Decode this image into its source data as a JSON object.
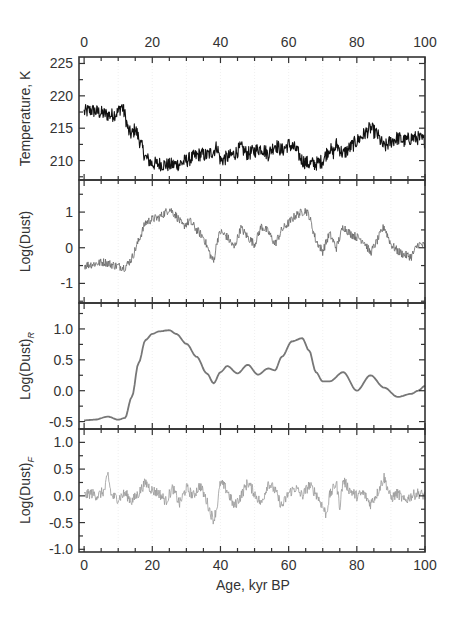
{
  "chart_data": [
    {
      "type": "line",
      "panel": 1,
      "ylabel": "Temperature, K",
      "ylim": [
        207,
        226
      ],
      "yticks": [
        210,
        215,
        220,
        225
      ],
      "color": "#111111",
      "noise": 1.1,
      "x": [
        0,
        2,
        4,
        6,
        8,
        10,
        11,
        12,
        13,
        14,
        15,
        16,
        18,
        20,
        22,
        25,
        28,
        30,
        32,
        34,
        36,
        38,
        39,
        40,
        42,
        44,
        46,
        48,
        50,
        52,
        54,
        56,
        58,
        60,
        62,
        64,
        66,
        68,
        70,
        72,
        73,
        74,
        76,
        78,
        80,
        82,
        84,
        86,
        88,
        90,
        92,
        94,
        96,
        98,
        100
      ],
      "values": [
        217.5,
        217.8,
        217.5,
        217.2,
        217.0,
        217.5,
        218.5,
        217.0,
        214.5,
        214.0,
        215.0,
        213.5,
        210.5,
        209.5,
        209.5,
        209.3,
        209.5,
        210.0,
        210.5,
        211.0,
        210.8,
        211.5,
        212.2,
        210.0,
        210.5,
        211.0,
        212.0,
        211.0,
        211.5,
        212.0,
        211.0,
        212.5,
        211.5,
        212.5,
        211.8,
        210.0,
        209.5,
        209.5,
        210.0,
        212.0,
        211.0,
        212.5,
        211.0,
        212.0,
        213.0,
        214.0,
        215.0,
        214.0,
        212.0,
        213.0,
        213.5,
        213.0,
        213.5,
        213.5,
        213.0
      ]
    },
    {
      "type": "line",
      "panel": 2,
      "ylabel": "Log(Dust)",
      "ylim": [
        -1.55,
        1.9
      ],
      "yticks": [
        -1,
        0,
        1
      ],
      "color": "#666666",
      "noise": 0.12,
      "x": [
        0,
        3,
        6,
        9,
        12,
        14,
        16,
        18,
        20,
        22,
        24,
        25,
        27,
        29,
        31,
        33,
        35,
        37,
        38,
        39,
        40,
        42,
        44,
        46,
        48,
        50,
        52,
        54,
        56,
        58,
        60,
        62,
        64,
        65,
        66,
        68,
        70,
        72,
        74,
        76,
        78,
        80,
        82,
        84,
        86,
        88,
        90,
        92,
        94,
        96,
        98,
        100
      ],
      "values": [
        -0.5,
        -0.45,
        -0.4,
        -0.5,
        -0.55,
        -0.3,
        0.2,
        0.7,
        0.8,
        0.85,
        1.0,
        1.1,
        0.9,
        0.6,
        0.75,
        0.5,
        0.3,
        -0.2,
        -0.4,
        0.2,
        0.45,
        0.3,
        0.0,
        0.55,
        0.3,
        0.1,
        0.6,
        0.45,
        0.1,
        0.5,
        0.7,
        0.9,
        1.0,
        1.05,
        0.9,
        0.2,
        -0.1,
        0.4,
        0.0,
        0.6,
        0.4,
        0.3,
        0.2,
        -0.15,
        0.2,
        0.6,
        0.1,
        -0.1,
        -0.2,
        -0.25,
        0.1,
        0.05
      ]
    },
    {
      "type": "line",
      "panel": 3,
      "ylabel": "Log(Dust)",
      "ylabel_subscript": "R",
      "ylim": [
        -0.62,
        1.42
      ],
      "yticks": [
        -0.5,
        0.0,
        0.5,
        1.0
      ],
      "ytick_labels": [
        "-0.5",
        "0.0",
        "0.5",
        "1.0"
      ],
      "color": "#777777",
      "noise": 0,
      "x": [
        0,
        3,
        7,
        10,
        12,
        14,
        16,
        18,
        20,
        22,
        25,
        27,
        30,
        33,
        36,
        38,
        40,
        42,
        45,
        48,
        51,
        54,
        56,
        58,
        61,
        64,
        66,
        68,
        70,
        72,
        76,
        80,
        84,
        88,
        92,
        96,
        98,
        100
      ],
      "values": [
        -0.48,
        -0.47,
        -0.42,
        -0.47,
        -0.44,
        -0.1,
        0.45,
        0.82,
        0.92,
        0.96,
        0.98,
        0.92,
        0.76,
        0.55,
        0.28,
        0.12,
        0.3,
        0.4,
        0.28,
        0.42,
        0.26,
        0.36,
        0.33,
        0.55,
        0.8,
        0.85,
        0.65,
        0.3,
        0.15,
        0.15,
        0.3,
        0.0,
        0.25,
        0.05,
        -0.1,
        -0.05,
        0.0,
        0.08
      ]
    },
    {
      "type": "line",
      "panel": 4,
      "ylabel": "Log(Dust)",
      "ylabel_subscript": "F",
      "ylim": [
        -1.05,
        1.25
      ],
      "yticks": [
        -1.0,
        -0.5,
        0.0,
        0.5,
        1.0
      ],
      "ytick_labels": [
        "-1.0",
        "-0.5",
        "0.0",
        "0.5",
        "1.0"
      ],
      "color": "#999999",
      "noise": 0.1,
      "x": [
        0,
        2,
        4,
        6,
        7,
        8,
        10,
        12,
        14,
        16,
        18,
        20,
        22,
        24,
        26,
        28,
        30,
        32,
        34,
        36,
        37,
        38,
        39,
        40,
        42,
        44,
        46,
        48,
        50,
        52,
        54,
        56,
        58,
        60,
        62,
        64,
        66,
        68,
        70,
        71,
        72,
        74,
        75,
        76,
        78,
        80,
        82,
        84,
        86,
        88,
        90,
        92,
        94,
        96,
        98,
        100
      ],
      "values": [
        0.0,
        0.05,
        0.0,
        0.1,
        0.4,
        0.0,
        -0.05,
        0.05,
        -0.1,
        0.05,
        0.25,
        0.1,
        0.05,
        -0.1,
        0.15,
        -0.15,
        0.15,
        0.0,
        0.2,
        -0.1,
        -0.3,
        -0.45,
        -0.2,
        0.25,
        0.1,
        -0.2,
        0.0,
        0.25,
        0.05,
        -0.15,
        0.25,
        0.1,
        -0.2,
        0.05,
        0.15,
        0.0,
        0.2,
        0.05,
        -0.2,
        -0.35,
        0.0,
        0.25,
        -0.2,
        0.3,
        0.1,
        0.0,
        0.05,
        -0.15,
        0.05,
        0.35,
        -0.05,
        0.05,
        -0.1,
        0.0,
        0.05,
        0.0
      ]
    }
  ],
  "xaxis": {
    "label": "Age, kyr BP",
    "ticks": [
      0,
      20,
      40,
      60,
      80,
      100
    ],
    "tick_labels": [
      "0",
      "20",
      "40",
      "60",
      "80",
      "100"
    ],
    "xlim": [
      -1.5,
      100
    ]
  }
}
